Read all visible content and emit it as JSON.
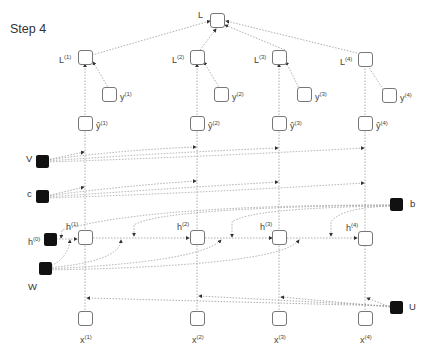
{
  "title": "Step 4",
  "nodes": {
    "L": "L",
    "losses": [
      {
        "base": "L",
        "sup": "(1)"
      },
      {
        "base": "L",
        "sup": "(2)"
      },
      {
        "base": "L",
        "sup": "(3)"
      },
      {
        "base": "L",
        "sup": "(4)"
      }
    ],
    "targets": [
      {
        "base": "y",
        "sup": "(1)"
      },
      {
        "base": "y",
        "sup": "(2)"
      },
      {
        "base": "y",
        "sup": "(3)"
      },
      {
        "base": "y",
        "sup": "(4)"
      }
    ],
    "outputs": [
      {
        "base": "ŷ",
        "sup": "(1)"
      },
      {
        "base": "ŷ",
        "sup": "(2)"
      },
      {
        "base": "ŷ",
        "sup": "(3)"
      },
      {
        "base": "ŷ",
        "sup": "(4)"
      }
    ],
    "hidden": [
      {
        "base": "h",
        "sup": "(1)"
      },
      {
        "base": "h",
        "sup": "(2)"
      },
      {
        "base": "h",
        "sup": "(3)"
      },
      {
        "base": "h",
        "sup": "(4)"
      }
    ],
    "inputs": [
      {
        "base": "x",
        "sup": "(1)"
      },
      {
        "base": "x",
        "sup": "(2)"
      },
      {
        "base": "x",
        "sup": "(3)"
      },
      {
        "base": "x",
        "sup": "(4)"
      }
    ],
    "h0": {
      "base": "h",
      "sup": "(0)"
    }
  },
  "parameters": {
    "V": "V",
    "c": "c",
    "b": "b",
    "W": "W",
    "U": "U"
  },
  "colors": {
    "node_border": "#777777",
    "param_fill": "#111111",
    "edge": "#888888"
  }
}
